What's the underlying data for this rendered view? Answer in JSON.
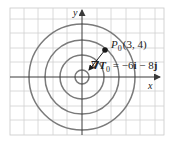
{
  "diagram": {
    "type": "level-curves-with-gradient",
    "axes": {
      "x_label": "x",
      "y_label": "y"
    },
    "curves": {
      "shape": "concentric circles",
      "count": 4,
      "color": "#7a7a7a"
    },
    "point": {
      "name_main": "P",
      "name_sub": "0",
      "coords": "(3, 4)"
    },
    "gradient": {
      "symbol": "∇T",
      "sub": "0",
      "equals": " = −6",
      "i": "i",
      "minus": " − 8",
      "j": "j"
    },
    "colors": {
      "grid": "#d0d0d0",
      "axes": "#3a3a3a",
      "curves": "#7a7a7a",
      "point": "#1a1a1a"
    }
  }
}
